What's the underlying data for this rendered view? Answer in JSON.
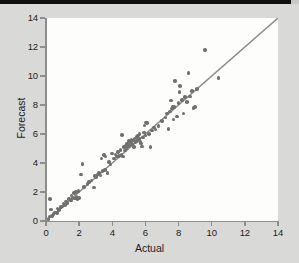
{
  "figure": {
    "background_color": "#d9d9d7",
    "plot_background_color": "#fdfdfc",
    "axis_color": "#8d8d8c",
    "point_color": "#6f6f6e",
    "line_color": "#8d8d8c",
    "top_band_color": "#12100f"
  },
  "chart_data": {
    "type": "scatter",
    "title": "",
    "xlabel": "Actual",
    "ylabel": "Forecast",
    "xlim": [
      0,
      14
    ],
    "ylim": [
      0,
      14
    ],
    "xticks": [
      0,
      2,
      4,
      6,
      8,
      10,
      12,
      14
    ],
    "yticks": [
      0,
      2,
      4,
      6,
      8,
      10,
      12,
      14
    ],
    "xticklabels": [
      "0",
      "2",
      "4",
      "6",
      "8",
      "10",
      "12",
      "14"
    ],
    "yticklabels": [
      "0",
      "2",
      "4",
      "6",
      "8",
      "10",
      "12",
      "14"
    ],
    "grid": false,
    "legend": null,
    "reference_line": {
      "label": "y = x",
      "from": [
        0,
        0
      ],
      "to": [
        14,
        14
      ],
      "style": "solid"
    },
    "series": [
      {
        "name": "Forecast vs Actual",
        "marker": "circle",
        "points": [
          [
            0.15,
            0.15
          ],
          [
            0.2,
            0.3
          ],
          [
            0.25,
            1.5
          ],
          [
            0.3,
            0.8
          ],
          [
            0.35,
            0.35
          ],
          [
            0.45,
            0.5
          ],
          [
            0.55,
            0.6
          ],
          [
            0.65,
            0.55
          ],
          [
            0.7,
            0.85
          ],
          [
            0.8,
            0.75
          ],
          [
            0.9,
            0.95
          ],
          [
            1.0,
            1.0
          ],
          [
            1.05,
            1.2
          ],
          [
            1.15,
            1.1
          ],
          [
            1.2,
            1.35
          ],
          [
            1.3,
            1.25
          ],
          [
            1.4,
            1.5
          ],
          [
            1.5,
            1.4
          ],
          [
            1.55,
            1.75
          ],
          [
            1.6,
            1.6
          ],
          [
            1.7,
            1.95
          ],
          [
            1.75,
            1.55
          ],
          [
            1.8,
            2.0
          ],
          [
            1.85,
            1.7
          ],
          [
            1.9,
            1.5
          ],
          [
            1.95,
            2.05
          ],
          [
            2.0,
            1.6
          ],
          [
            2.1,
            3.2
          ],
          [
            2.2,
            3.95
          ],
          [
            2.3,
            2.35
          ],
          [
            2.5,
            2.55
          ],
          [
            2.6,
            2.7
          ],
          [
            2.75,
            2.8
          ],
          [
            2.9,
            2.3
          ],
          [
            2.95,
            3.1
          ],
          [
            3.0,
            3.05
          ],
          [
            3.1,
            3.2
          ],
          [
            3.2,
            3.3
          ],
          [
            3.3,
            3.15
          ],
          [
            3.35,
            4.3
          ],
          [
            3.4,
            3.45
          ],
          [
            3.5,
            4.55
          ],
          [
            3.55,
            3.5
          ],
          [
            3.6,
            4.45
          ],
          [
            3.7,
            3.3
          ],
          [
            3.8,
            4.05
          ],
          [
            3.9,
            3.9
          ],
          [
            4.0,
            4.65
          ],
          [
            4.1,
            4.3
          ],
          [
            4.2,
            4.6
          ],
          [
            4.3,
            4.45
          ],
          [
            4.35,
            4.75
          ],
          [
            4.4,
            4.5
          ],
          [
            4.5,
            4.9
          ],
          [
            4.55,
            4.6
          ],
          [
            4.6,
            5.95
          ],
          [
            4.65,
            4.45
          ],
          [
            4.7,
            5.1
          ],
          [
            4.75,
            4.85
          ],
          [
            4.8,
            5.2
          ],
          [
            4.85,
            5.0
          ],
          [
            4.9,
            5.35
          ],
          [
            4.95,
            5.15
          ],
          [
            5.0,
            5.5
          ],
          [
            5.05,
            5.25
          ],
          [
            5.1,
            5.4
          ],
          [
            5.15,
            5.6
          ],
          [
            5.2,
            5.3
          ],
          [
            5.25,
            5.55
          ],
          [
            5.3,
            5.1
          ],
          [
            5.35,
            5.7
          ],
          [
            5.4,
            5.45
          ],
          [
            5.45,
            5.8
          ],
          [
            5.5,
            5.5
          ],
          [
            5.55,
            5.9
          ],
          [
            5.6,
            5.65
          ],
          [
            5.65,
            6.0
          ],
          [
            5.7,
            5.45
          ],
          [
            5.75,
            5.35
          ],
          [
            5.8,
            5.15
          ],
          [
            5.85,
            5.75
          ],
          [
            5.9,
            6.1
          ],
          [
            5.95,
            6.6
          ],
          [
            6.0,
            5.9
          ],
          [
            6.05,
            6.8
          ],
          [
            6.1,
            6.75
          ],
          [
            6.2,
            6.0
          ],
          [
            6.3,
            5.1
          ],
          [
            6.4,
            6.25
          ],
          [
            6.5,
            6.45
          ],
          [
            6.6,
            6.3
          ],
          [
            6.8,
            6.55
          ],
          [
            7.0,
            6.9
          ],
          [
            7.2,
            7.15
          ],
          [
            7.3,
            7.4
          ],
          [
            7.4,
            6.35
          ],
          [
            7.5,
            7.55
          ],
          [
            7.55,
            8.3
          ],
          [
            7.6,
            7.75
          ],
          [
            7.65,
            7.9
          ],
          [
            7.7,
            7.0
          ],
          [
            7.75,
            7.85
          ],
          [
            7.8,
            9.65
          ],
          [
            7.9,
            7.2
          ],
          [
            8.0,
            8.15
          ],
          [
            8.05,
            8.9
          ],
          [
            8.1,
            9.3
          ],
          [
            8.2,
            8.35
          ],
          [
            8.3,
            7.4
          ],
          [
            8.4,
            8.55
          ],
          [
            8.5,
            8.2
          ],
          [
            8.6,
            10.2
          ],
          [
            8.7,
            8.6
          ],
          [
            8.8,
            8.95
          ],
          [
            8.9,
            7.8
          ],
          [
            9.0,
            7.85
          ],
          [
            9.1,
            9.1
          ],
          [
            9.6,
            11.8
          ],
          [
            10.4,
            9.85
          ]
        ]
      }
    ]
  }
}
